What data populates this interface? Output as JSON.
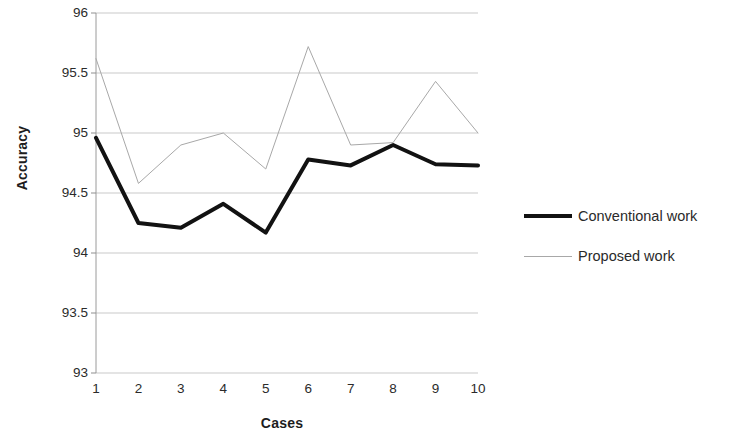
{
  "chart_data": {
    "type": "line",
    "title": "",
    "xlabel": "Cases",
    "ylabel": "Accuracy",
    "categories": [
      "1",
      "2",
      "3",
      "4",
      "5",
      "6",
      "7",
      "8",
      "9",
      "10"
    ],
    "x": [
      1,
      2,
      3,
      4,
      5,
      6,
      7,
      8,
      9,
      10
    ],
    "series": [
      {
        "name": "Conventional work",
        "color": "#121212",
        "style": "thick-solid",
        "values": [
          94.96,
          94.25,
          94.21,
          94.41,
          94.17,
          94.78,
          94.73,
          94.9,
          94.74,
          94.73
        ]
      },
      {
        "name": "Proposed work",
        "color": "#a8a8a8",
        "style": "thin-solid",
        "values": [
          95.62,
          94.58,
          94.9,
          95.0,
          94.7,
          95.72,
          94.9,
          94.92,
          95.43,
          95.0
        ]
      }
    ],
    "ylim": [
      93,
      96
    ],
    "yticks": [
      93,
      93.5,
      94,
      94.5,
      95,
      95.5,
      96
    ],
    "ytick_labels": [
      "93",
      "93.5",
      "94",
      "94.5",
      "95",
      "95.5",
      "96"
    ],
    "xlim": [
      1,
      10
    ],
    "grid": "horizontal",
    "grid_color": "#c9c9c9",
    "legend_position": "right",
    "legend": [
      "Conventional work",
      "Proposed work"
    ]
  }
}
